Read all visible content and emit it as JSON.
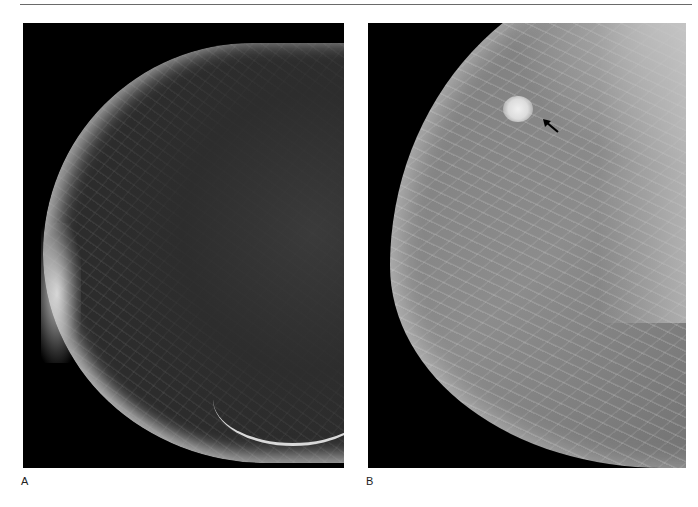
{
  "figure": {
    "header_fragment": "· · ·",
    "panels": [
      {
        "id": "A",
        "label": "A",
        "description": "Mammogram, fatty breast tissue"
      },
      {
        "id": "B",
        "label": "B",
        "description": "Mammogram, dense breast tissue with mass",
        "annotation": {
          "type": "arrow",
          "icon": "arrow-up-left-icon",
          "points_to": "mass"
        }
      }
    ],
    "colors": {
      "background": "#ffffff",
      "film": "#000000",
      "rule": "#6a6a6a",
      "label_text": "#222222"
    }
  }
}
